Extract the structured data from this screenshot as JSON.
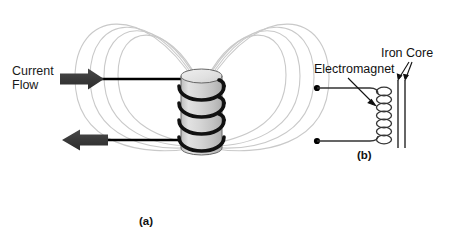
{
  "figure": {
    "width": 451,
    "height": 239,
    "background_color": "#ffffff"
  },
  "panel_a": {
    "caption": "(a)",
    "labels": {
      "current_flow": "Current\nFlow"
    },
    "elements": {
      "coil_name": "solenoid-coil",
      "cylinder_name": "iron-cylinder-core",
      "field_lines_name": "magnetic-field-lines",
      "arrow_in_name": "current-arrow-in",
      "arrow_out_name": "current-arrow-out"
    },
    "colors": {
      "wire": "#000000",
      "arrow_fill": "#3a3a3a",
      "cylinder_fill": "#d4d4d4",
      "cylinder_top_fill": "#e6e6e6",
      "cylinder_stroke": "#555555",
      "field_line": "#c9c9c9"
    },
    "counts": {
      "coil_turns": 4,
      "field_loops_per_side": 4
    }
  },
  "panel_b": {
    "caption": "(b)",
    "labels": {
      "electromagnet": "Electromagnet",
      "iron_core": "Iron Core"
    },
    "elements": {
      "terminal_top_name": "circuit-terminal-top",
      "terminal_bottom_name": "circuit-terminal-bottom",
      "coil_name": "electromagnet-coil-symbol",
      "core_name": "iron-core-bars",
      "pointer_electromagnet_name": "electromagnet-pointer-arrow",
      "pointer_core_name": "iron-core-pointer-arrows"
    },
    "colors": {
      "wire": "#333333",
      "terminal": "#000000",
      "core_bar": "#333333"
    },
    "counts": {
      "coil_turns": 7,
      "core_bars": 2
    }
  }
}
